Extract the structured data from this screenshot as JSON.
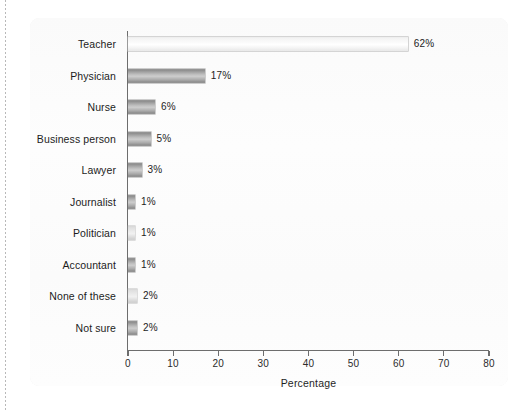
{
  "chart_data": {
    "type": "bar",
    "orientation": "horizontal",
    "title": "",
    "xlabel": "Percentage",
    "ylabel": "",
    "xlim": [
      0,
      80
    ],
    "xticks": [
      0,
      10,
      20,
      30,
      40,
      50,
      60,
      70,
      80
    ],
    "xtick_labels": [
      "0",
      "10",
      "20",
      "30",
      "40",
      "50",
      "60",
      "70",
      "80"
    ],
    "grid": false,
    "legend": null,
    "categories": [
      "Teacher",
      "Physician",
      "Nurse",
      "Business person",
      "Lawyer",
      "Journalist",
      "Politician",
      "Accountant",
      "None of these",
      "Not sure"
    ],
    "values": [
      62,
      17,
      6,
      5,
      3,
      1,
      1,
      1,
      2,
      2
    ],
    "value_labels": [
      "62%",
      "17%",
      "6%",
      "5%",
      "3%",
      "1%",
      "1%",
      "1%",
      "2%",
      "2%"
    ],
    "bar_shades": [
      "pale",
      "dark",
      "dark",
      "dark",
      "dark",
      "dark",
      "light",
      "dark",
      "light",
      "dark"
    ]
  },
  "colors": {
    "panel_background": "#fcfcfc",
    "page_background": "#ffffff",
    "axis": "#6d6d6d",
    "text": "#1c1c1c",
    "bar_dark": "#a9a9a9",
    "bar_light": "#dcdcdc",
    "bar_pale": "#f5f5f5"
  }
}
